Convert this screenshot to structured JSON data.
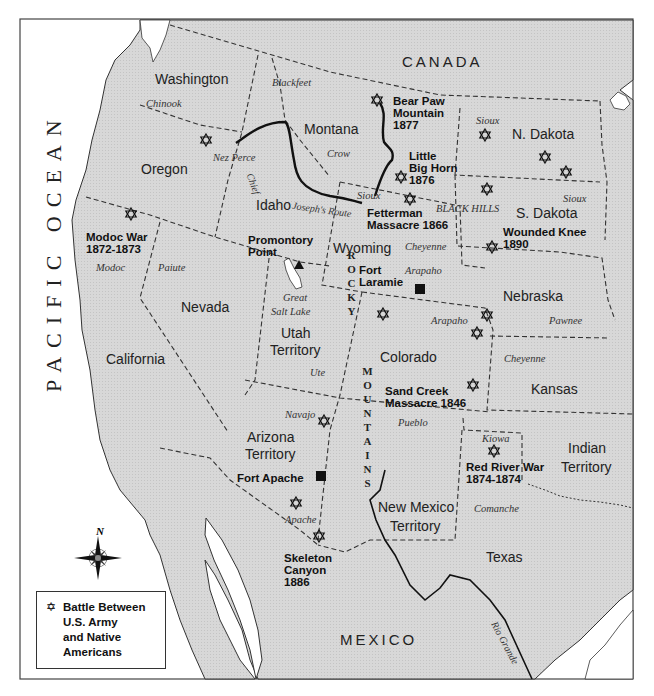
{
  "map": {
    "title": "",
    "colors": {
      "land": "#d9d9d9",
      "water": "#ffffff",
      "border": "#333333",
      "route": "#111111"
    },
    "regions": {
      "ocean": "PACIFIC OCEAN",
      "canada": "CANADA",
      "mexico": "MEXICO"
    },
    "states": [
      {
        "name": "Washington",
        "x": 155,
        "y": 72
      },
      {
        "name": "Oregon",
        "x": 141,
        "y": 162
      },
      {
        "name": "Montana",
        "x": 304,
        "y": 122
      },
      {
        "name": "Idaho",
        "x": 256,
        "y": 198
      },
      {
        "name": "N. Dakota",
        "x": 512,
        "y": 127
      },
      {
        "name": "S. Dakota",
        "x": 516,
        "y": 206
      },
      {
        "name": "Wyoming",
        "x": 333,
        "y": 241
      },
      {
        "name": "Nevada",
        "x": 181,
        "y": 300
      },
      {
        "name": "Utah",
        "x": 281,
        "y": 326
      },
      {
        "name": "Territory",
        "x": 270,
        "y": 343
      },
      {
        "name": "Nebraska",
        "x": 503,
        "y": 289
      },
      {
        "name": "Colorado",
        "x": 380,
        "y": 350
      },
      {
        "name": "California",
        "x": 106,
        "y": 352
      },
      {
        "name": "Kansas",
        "x": 531,
        "y": 382
      },
      {
        "name": "Arizona",
        "x": 247,
        "y": 430
      },
      {
        "name": "Territory",
        "x": 245,
        "y": 447
      },
      {
        "name": "Indian",
        "x": 568,
        "y": 441
      },
      {
        "name": "Territory",
        "x": 561,
        "y": 460
      },
      {
        "name": "New Mexico",
        "x": 378,
        "y": 500
      },
      {
        "name": "Territory",
        "x": 390,
        "y": 519
      },
      {
        "name": "Texas",
        "x": 486,
        "y": 550
      }
    ],
    "tribes": [
      {
        "name": "Blackfeet",
        "x": 272,
        "y": 77
      },
      {
        "name": "Chinook",
        "x": 146,
        "y": 98
      },
      {
        "name": "Nez Perce",
        "x": 213,
        "y": 152
      },
      {
        "name": "Crow",
        "x": 327,
        "y": 148
      },
      {
        "name": "Sioux",
        "x": 476,
        "y": 115
      },
      {
        "name": "Sioux",
        "x": 357,
        "y": 190
      },
      {
        "name": "Sioux",
        "x": 563,
        "y": 193
      },
      {
        "name": "BLACK HILLS",
        "x": 436,
        "y": 203
      },
      {
        "name": "Cheyenne",
        "x": 405,
        "y": 241
      },
      {
        "name": "Arapaho",
        "x": 405,
        "y": 265
      },
      {
        "name": "Modoc",
        "x": 96,
        "y": 262
      },
      {
        "name": "Paiute",
        "x": 158,
        "y": 262
      },
      {
        "name": "Great",
        "x": 283,
        "y": 292
      },
      {
        "name": "Salt Lake",
        "x": 271,
        "y": 306
      },
      {
        "name": "Arapaho",
        "x": 431,
        "y": 315
      },
      {
        "name": "Pawnee",
        "x": 549,
        "y": 315
      },
      {
        "name": "Ute",
        "x": 310,
        "y": 367
      },
      {
        "name": "Cheyenne",
        "x": 504,
        "y": 353
      },
      {
        "name": "Navajo",
        "x": 285,
        "y": 409
      },
      {
        "name": "Pueblo",
        "x": 398,
        "y": 417
      },
      {
        "name": "Kiowa",
        "x": 482,
        "y": 433
      },
      {
        "name": "Apache",
        "x": 285,
        "y": 514
      },
      {
        "name": "Comanche",
        "x": 474,
        "y": 503
      }
    ],
    "route": {
      "label": "Chief Joseph's Route",
      "label_part1": "Chief",
      "label_part2": "Joseph's Route"
    },
    "events": [
      {
        "name": "Bear Paw\nMountain\n1877",
        "x": 393,
        "y": 95
      },
      {
        "name": "Little\nBig Horn\n1876",
        "x": 409,
        "y": 150
      },
      {
        "name": "Fetterman\nMassacre 1866",
        "x": 367,
        "y": 207
      },
      {
        "name": "Wounded Knee\n1890",
        "x": 503,
        "y": 226
      },
      {
        "name": "Modoc War\n1872-1873",
        "x": 86,
        "y": 231
      },
      {
        "name": "Promontory\nPoint",
        "x": 248,
        "y": 234
      },
      {
        "name": "Fort\nLaramie",
        "x": 359,
        "y": 264
      },
      {
        "name": "Sand Creek\nMassacre 1846",
        "x": 385,
        "y": 385
      },
      {
        "name": "Red River War\n1874-1874",
        "x": 466,
        "y": 461
      },
      {
        "name": "Fort Apache",
        "x": 237,
        "y": 472
      },
      {
        "name": "Skeleton\nCanyon\n1886",
        "x": 284,
        "y": 552
      }
    ],
    "battle_sites": [
      {
        "x": 377,
        "y": 100
      },
      {
        "x": 206,
        "y": 140
      },
      {
        "x": 401,
        "y": 177
      },
      {
        "x": 485,
        "y": 135
      },
      {
        "x": 545,
        "y": 157
      },
      {
        "x": 566,
        "y": 172
      },
      {
        "x": 487,
        "y": 189
      },
      {
        "x": 410,
        "y": 199
      },
      {
        "x": 131,
        "y": 214
      },
      {
        "x": 492,
        "y": 247
      },
      {
        "x": 383,
        "y": 314
      },
      {
        "x": 487,
        "y": 315
      },
      {
        "x": 477,
        "y": 333
      },
      {
        "x": 473,
        "y": 385
      },
      {
        "x": 324,
        "y": 421
      },
      {
        "x": 494,
        "y": 451
      },
      {
        "x": 296,
        "y": 503
      },
      {
        "x": 319,
        "y": 536
      }
    ],
    "markers": [
      {
        "type": "fort",
        "label": "Fort Laramie",
        "x": 420,
        "y": 289
      },
      {
        "type": "fort",
        "label": "Fort Apache",
        "x": 321,
        "y": 476
      },
      {
        "type": "point",
        "label": "Promontory Point",
        "x": 299,
        "y": 265
      }
    ],
    "rocky_mountains": {
      "top": "ROCKY",
      "bottom": "MOUNTAINS"
    },
    "river": "Rio Grande",
    "compass": {
      "north_label": "N"
    },
    "legend": {
      "symbol": "✡",
      "text": "Battle Between\nU.S. Army\nand Native\nAmericans"
    }
  }
}
